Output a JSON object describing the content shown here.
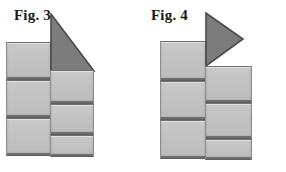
{
  "page": {
    "width": 286,
    "height": 172,
    "background": "#ffffff"
  },
  "palette": {
    "block_fill": "#c3c3c3",
    "block_edge": "#8e8e8e",
    "block_shadow_edge": "#5f5f5f",
    "triangle_fill": "#7c7c7c",
    "triangle_edge": "#4a4a4a",
    "label_color": "#1a1a1a"
  },
  "figures": [
    {
      "id": "figure-3",
      "label": "Fig. 3",
      "description": "Two stacks of three rectangular blocks with a dark right triangle resting on top of the right stack, hypotenuse sloping down to the right.",
      "stacks": [
        {
          "name": "left-stack",
          "block_count": 3,
          "blocks": [
            {
              "x": 6,
              "y": 42,
              "w": 45,
              "h": 38
            },
            {
              "x": 6,
              "y": 80,
              "w": 45,
              "h": 38
            },
            {
              "x": 6,
              "y": 118,
              "w": 45,
              "h": 38
            }
          ]
        },
        {
          "name": "right-stack",
          "block_count": 3,
          "blocks": [
            {
              "x": 50,
              "y": 70,
              "w": 44,
              "h": 34
            },
            {
              "x": 50,
              "y": 104,
              "w": 44,
              "h": 31
            },
            {
              "x": 50,
              "y": 135,
              "w": 44,
              "h": 22
            }
          ]
        }
      ],
      "triangle": {
        "name": "roof-triangle",
        "shape": "right-triangle",
        "orientation": "vertical-left-edge-hypotenuse-down-right",
        "x": 50,
        "y": 13,
        "w": 44,
        "h": 57
      }
    },
    {
      "id": "figure-4",
      "label": "Fig. 4",
      "description": "Two stacks of three rectangular blocks with a dark right-pointing triangle attached at the top of the taller left stack, apex directed to the right.",
      "stacks": [
        {
          "name": "left-stack",
          "block_count": 3,
          "blocks": [
            {
              "x": 17,
              "y": 41,
              "w": 46,
              "h": 40
            },
            {
              "x": 17,
              "y": 81,
              "w": 46,
              "h": 39
            },
            {
              "x": 17,
              "y": 120,
              "w": 46,
              "h": 39
            }
          ]
        },
        {
          "name": "right-stack",
          "block_count": 3,
          "blocks": [
            {
              "x": 62,
              "y": 66,
              "w": 47,
              "h": 37
            },
            {
              "x": 62,
              "y": 103,
              "w": 47,
              "h": 36
            },
            {
              "x": 62,
              "y": 139,
              "w": 47,
              "h": 21
            }
          ]
        }
      ],
      "triangle": {
        "name": "flag-triangle",
        "shape": "right-triangle",
        "orientation": "vertical-left-edge-apex-right",
        "x": 62,
        "y": 12,
        "w": 37,
        "h": 54
      }
    }
  ]
}
